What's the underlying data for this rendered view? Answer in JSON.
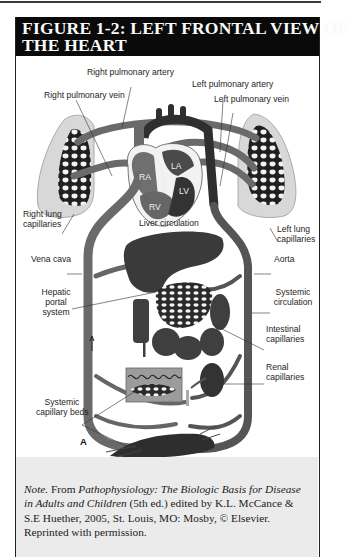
{
  "figure": {
    "title_line1": "FIGURE 1-2: LEFT FRONTAL VIEW OF",
    "title_line2": "THE HEART",
    "panel_letter": "A",
    "chambers": {
      "ra": "RA",
      "la": "LA",
      "rv": "RV",
      "lv": "LV"
    },
    "labels": {
      "right_pulmonary_artery": "Right pulmonary artery",
      "left_pulmonary_artery": "Left pulmonary artery",
      "right_pulmonary_vein": "Right pulmonary vein",
      "left_pulmonary_vein": "Left pulmonary vein",
      "right_lung_capillaries_1": "Right lung",
      "right_lung_capillaries_2": "capillaries",
      "left_lung_capillaries_1": "Left lung",
      "left_lung_capillaries_2": "capillaries",
      "liver_circulation": "Liver circulation",
      "vena_cava": "Vena cava",
      "aorta": "Aorta",
      "hepatic_portal_1": "Hepatic",
      "hepatic_portal_2": "portal",
      "hepatic_portal_3": "system",
      "systemic_circulation_1": "Systemic",
      "systemic_circulation_2": "circulation",
      "intestinal_capillaries_1": "Intestinal",
      "intestinal_capillaries_2": "capillaries",
      "renal_capillaries_1": "Renal",
      "renal_capillaries_2": "capillaries",
      "systemic_capillary_beds_1": "Systemic",
      "systemic_capillary_beds_2": "capillary beds"
    },
    "colors": {
      "header_bg": "#0a0a0a",
      "header_text": "#fafafa",
      "vessel": "#5a5a5a",
      "organ": "#3c3c3c",
      "lung_fill": "#d6d6d6",
      "note_bg": "#ebebeb"
    }
  },
  "note": {
    "prefix_italic": "Note.",
    "from": " From ",
    "book_title": "Pathophysiology: The Biologic Basis for Disease in Adults and Children",
    "details": " (5th ed.) edited by K.L. McCance & S.E Huether, 2005, St. Louis, MO: Mosby, © Elsevier. Reprinted with permission."
  }
}
